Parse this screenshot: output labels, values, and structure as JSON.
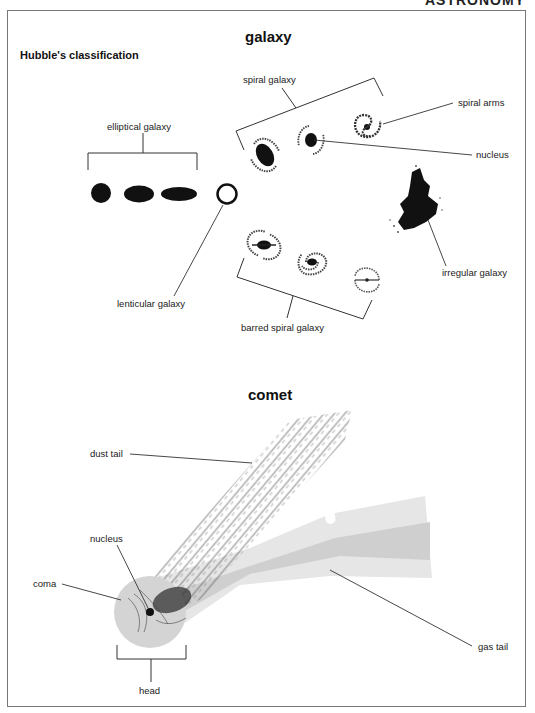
{
  "page": {
    "header_cut_text": "ASTRONOMY"
  },
  "galaxy": {
    "title": "galaxy",
    "subtitle": "Hubble's classification",
    "labels": {
      "elliptical": "elliptical galaxy",
      "spiral": "spiral galaxy",
      "spiral_arms": "spiral arms",
      "nucleus": "nucleus",
      "lenticular": "lenticular galaxy",
      "irregular": "irregular galaxy",
      "barred_spiral": "barred spiral galaxy"
    }
  },
  "comet": {
    "title": "comet",
    "labels": {
      "dust_tail": "dust tail",
      "nucleus": "nucleus",
      "coma": "coma",
      "gas_tail": "gas tail",
      "head": "head"
    },
    "colors": {
      "gas_tail_light": "#e6e6e6",
      "gas_tail_dark": "#cfcfcf",
      "coma": "#d4d4d4",
      "ink": "#1a1a1a"
    }
  }
}
